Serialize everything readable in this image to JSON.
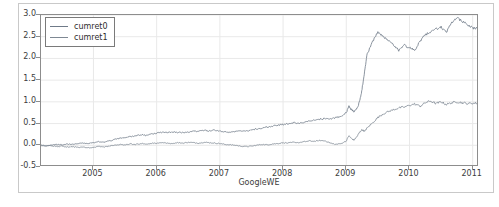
{
  "chart_data": {
    "type": "line",
    "title": "",
    "xlabel": "GoogleWE",
    "ylabel": "",
    "xlim": [
      2004.17,
      2011.1
    ],
    "ylim": [
      -0.5,
      3.0
    ],
    "grid": true,
    "legend_position": "upper left",
    "xticks": [
      2005,
      2006,
      2007,
      2008,
      2009,
      2010,
      2011
    ],
    "xtick_labels": [
      "2005",
      "2006",
      "2007",
      "2008",
      "2009",
      "2010",
      "2011"
    ],
    "yticks": [
      -0.5,
      0.0,
      0.5,
      1.0,
      1.5,
      2.0,
      2.5,
      3.0
    ],
    "ytick_labels": [
      "-0.5",
      "0.0",
      "0.5",
      "1.0",
      "1.5",
      "2.0",
      "2.5",
      "3.0"
    ],
    "series": [
      {
        "name": "cumret0",
        "color": "#6f7a88",
        "x": [
          2004.17,
          2004.25,
          2004.33,
          2004.42,
          2004.5,
          2004.58,
          2004.67,
          2004.75,
          2004.83,
          2004.92,
          2005.0,
          2005.08,
          2005.17,
          2005.25,
          2005.33,
          2005.42,
          2005.5,
          2005.58,
          2005.67,
          2005.75,
          2005.83,
          2005.92,
          2006.0,
          2006.08,
          2006.17,
          2006.25,
          2006.33,
          2006.42,
          2006.5,
          2006.58,
          2006.67,
          2006.75,
          2006.83,
          2006.92,
          2007.0,
          2007.08,
          2007.17,
          2007.25,
          2007.33,
          2007.42,
          2007.5,
          2007.58,
          2007.67,
          2007.75,
          2007.83,
          2007.92,
          2008.0,
          2008.08,
          2008.17,
          2008.25,
          2008.33,
          2008.42,
          2008.5,
          2008.58,
          2008.67,
          2008.75,
          2008.83,
          2008.92,
          2009.0,
          2009.04,
          2009.08,
          2009.12,
          2009.17,
          2009.21,
          2009.25,
          2009.29,
          2009.33,
          2009.42,
          2009.5,
          2009.58,
          2009.67,
          2009.75,
          2009.83,
          2009.92,
          2010.0,
          2010.08,
          2010.17,
          2010.25,
          2010.33,
          2010.42,
          2010.5,
          2010.58,
          2010.67,
          2010.75,
          2010.83,
          2010.92,
          2011.0,
          2011.08
        ],
        "y": [
          0.0,
          -0.01,
          0.0,
          0.02,
          0.01,
          0.03,
          0.02,
          0.04,
          0.05,
          0.04,
          0.06,
          0.08,
          0.07,
          0.1,
          0.13,
          0.16,
          0.18,
          0.2,
          0.22,
          0.24,
          0.23,
          0.26,
          0.28,
          0.3,
          0.29,
          0.31,
          0.3,
          0.29,
          0.31,
          0.33,
          0.32,
          0.34,
          0.33,
          0.35,
          0.33,
          0.31,
          0.3,
          0.32,
          0.34,
          0.33,
          0.35,
          0.38,
          0.4,
          0.42,
          0.44,
          0.46,
          0.48,
          0.5,
          0.52,
          0.5,
          0.53,
          0.56,
          0.58,
          0.6,
          0.62,
          0.6,
          0.64,
          0.66,
          0.75,
          0.9,
          0.82,
          0.78,
          0.85,
          1.0,
          1.3,
          1.7,
          2.1,
          2.4,
          2.62,
          2.5,
          2.42,
          2.3,
          2.18,
          2.3,
          2.25,
          2.18,
          2.4,
          2.55,
          2.6,
          2.68,
          2.72,
          2.6,
          2.82,
          2.95,
          2.85,
          2.78,
          2.7,
          2.68
        ],
        "final_value": 2.7
      },
      {
        "name": "cumret1",
        "color": "#7e8893",
        "x": [
          2004.17,
          2004.25,
          2004.33,
          2004.42,
          2004.5,
          2004.58,
          2004.67,
          2004.75,
          2004.83,
          2004.92,
          2005.0,
          2005.08,
          2005.17,
          2005.25,
          2005.33,
          2005.42,
          2005.5,
          2005.58,
          2005.67,
          2005.75,
          2005.83,
          2005.92,
          2006.0,
          2006.08,
          2006.17,
          2006.25,
          2006.33,
          2006.42,
          2006.5,
          2006.58,
          2006.67,
          2006.75,
          2006.83,
          2006.92,
          2007.0,
          2007.08,
          2007.17,
          2007.25,
          2007.33,
          2007.42,
          2007.5,
          2007.58,
          2007.67,
          2007.75,
          2007.83,
          2007.92,
          2008.0,
          2008.08,
          2008.17,
          2008.25,
          2008.33,
          2008.42,
          2008.5,
          2008.58,
          2008.67,
          2008.75,
          2008.83,
          2008.92,
          2009.0,
          2009.04,
          2009.08,
          2009.12,
          2009.17,
          2009.21,
          2009.25,
          2009.29,
          2009.33,
          2009.42,
          2009.5,
          2009.58,
          2009.67,
          2009.75,
          2009.83,
          2009.92,
          2010.0,
          2010.08,
          2010.17,
          2010.25,
          2010.33,
          2010.42,
          2010.5,
          2010.58,
          2010.67,
          2010.75,
          2010.83,
          2010.92,
          2011.0,
          2011.08
        ],
        "y": [
          0.0,
          -0.02,
          -0.01,
          -0.03,
          -0.02,
          -0.04,
          -0.03,
          -0.05,
          -0.04,
          -0.06,
          -0.05,
          -0.03,
          -0.04,
          -0.02,
          0.0,
          0.02,
          0.01,
          0.03,
          0.02,
          0.04,
          0.03,
          0.05,
          0.04,
          0.06,
          0.05,
          0.04,
          0.06,
          0.05,
          0.07,
          0.06,
          0.05,
          0.07,
          0.06,
          0.05,
          0.04,
          0.02,
          0.01,
          0.0,
          -0.02,
          -0.03,
          -0.02,
          0.0,
          0.02,
          0.01,
          0.03,
          0.04,
          0.06,
          0.05,
          0.07,
          0.06,
          0.08,
          0.1,
          0.09,
          0.11,
          0.1,
          0.05,
          0.02,
          0.04,
          0.1,
          0.22,
          0.16,
          0.12,
          0.2,
          0.3,
          0.36,
          0.32,
          0.4,
          0.52,
          0.64,
          0.72,
          0.78,
          0.82,
          0.86,
          0.88,
          0.92,
          0.95,
          0.9,
          0.98,
          1.02,
          0.96,
          1.0,
          0.94,
          0.98,
          1.0,
          0.98,
          0.96,
          0.97,
          0.97
        ],
        "final_value": 1.0
      }
    ]
  },
  "legend": {
    "entries": [
      {
        "label": "cumret0"
      },
      {
        "label": "cumret1"
      }
    ]
  }
}
